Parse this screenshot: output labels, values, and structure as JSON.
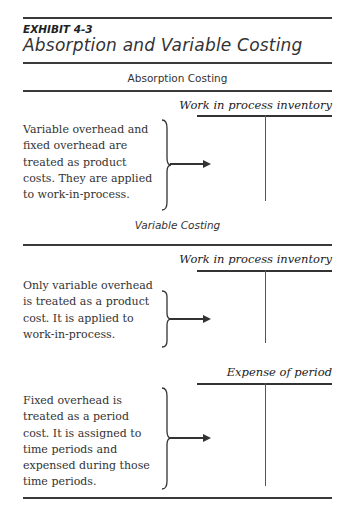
{
  "exhibit": {
    "label": "EXHIBIT 4-3",
    "title": "Absorption and Variable Costing"
  },
  "sections": [
    {
      "heading": "Absorption Costing",
      "rows": [
        {
          "description": "Variable overhead and fixed overhead are treated as product costs. They are applied to work-in-process.",
          "account": "Work in process inventory"
        }
      ]
    },
    {
      "heading": "Variable Costing",
      "rows": [
        {
          "description": "Only variable overhead is treated as a product cost. It is applied to work-in-process.",
          "account": "Work in process inventory"
        },
        {
          "description": "Fixed overhead is treated as a period cost. It is assigned to time periods and expensed during those time periods.",
          "account": "Expense of period"
        }
      ]
    }
  ],
  "icons": {
    "brace": "right-curly-brace-icon",
    "arrow": "right-arrow-icon"
  }
}
